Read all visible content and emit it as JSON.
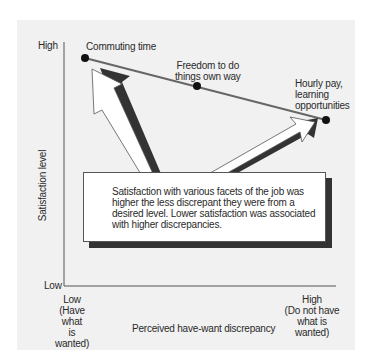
{
  "figure": {
    "y_axis": {
      "label": "Satisfaction level",
      "high": "High",
      "low": "Low"
    },
    "x_axis": {
      "label": "Perceived have-want discrepancy",
      "low": "Low\n(Have what\nis wanted)",
      "low_lines": [
        "Low",
        "(Have what",
        "is wanted)"
      ],
      "high_lines": [
        "High",
        "(Do not have",
        "what is wanted)"
      ]
    },
    "points": [
      {
        "label": "Commuting time",
        "x": 85,
        "y": 58
      },
      {
        "label_lines": [
          "Freedom to do",
          "things own way"
        ],
        "x": 197,
        "y": 86
      },
      {
        "label_lines": [
          "Hourly pay,",
          "learning",
          "opportunities"
        ],
        "x": 326,
        "y": 120
      }
    ],
    "callout": "Satisfaction with various facets of the job was higher the less discrepant they were from a desired level. Lower satisfaction was associated with higher discrepancies."
  }
}
